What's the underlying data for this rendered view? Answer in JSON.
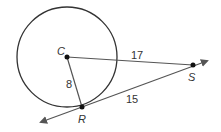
{
  "diagram": {
    "type": "circle-tangent",
    "circle": {
      "center_label": "C"
    },
    "points": {
      "C": {
        "label": "C"
      },
      "R": {
        "label": "R"
      },
      "S": {
        "label": "S"
      }
    },
    "segments": {
      "CR": {
        "label": "8"
      },
      "CS": {
        "label": "17"
      },
      "RS": {
        "label": "15"
      }
    },
    "colors": {
      "stroke": "#333333",
      "arrow": "#555555"
    }
  }
}
